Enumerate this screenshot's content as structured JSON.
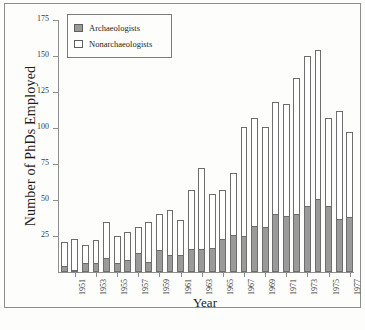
{
  "figure": {
    "y_axis_title": "Number of PhDs Employed",
    "x_axis_title": "Year"
  },
  "legend": {
    "position": "top-left",
    "entries": [
      {
        "label": "Archaeologists",
        "swatch": "filled-gray-square",
        "color": "#9a9a9a"
      },
      {
        "label": "Nonarchaeologists",
        "swatch": "open-white-square",
        "color": "#ffffff"
      }
    ]
  },
  "chart_data": {
    "type": "bar",
    "stacked": true,
    "title": "",
    "subtitle": "",
    "xlabel": "Year",
    "ylabel": "Number of PhDs Employed",
    "ylim": [
      0,
      175
    ],
    "ytick_values": [
      25,
      50,
      75,
      100,
      125,
      150,
      175
    ],
    "ytick_labels": [
      "25",
      "50",
      "75",
      "100",
      "125",
      "150",
      "175"
    ],
    "grid": false,
    "legend_position": "upper left",
    "categories": [
      "1950",
      "1951",
      "1952",
      "1953",
      "1954",
      "1955",
      "1956",
      "1957",
      "1958",
      "1959",
      "1960",
      "1961",
      "1962",
      "1963",
      "1964",
      "1965",
      "1966",
      "1967",
      "1968",
      "1969",
      "1970",
      "1971",
      "1972",
      "1973",
      "1974",
      "1975",
      "1976",
      "1977"
    ],
    "xtick_labels": [
      "",
      "1951",
      "",
      "1953",
      "",
      "1955",
      "",
      "1957",
      "",
      "1959",
      "",
      "1961",
      "",
      "1963",
      "",
      "1965",
      "",
      "1967",
      "",
      "1969",
      "",
      "1971",
      "",
      "1973",
      "",
      "1975",
      "",
      "1977"
    ],
    "series": [
      {
        "name": "Archaeologists",
        "color": "#9a9a9a",
        "values": [
          4,
          1,
          6,
          6,
          10,
          6,
          8,
          13,
          7,
          15,
          12,
          12,
          16,
          16,
          17,
          23,
          26,
          25,
          32,
          31,
          40,
          39,
          40,
          46,
          51,
          46,
          37,
          38
        ]
      },
      {
        "name": "Nonarchaeologists",
        "color": "#ffffff",
        "values": [
          17,
          22,
          13,
          16,
          25,
          19,
          20,
          18,
          28,
          25,
          31,
          24,
          41,
          56,
          37,
          34,
          43,
          76,
          75,
          70,
          78,
          78,
          95,
          104,
          103,
          61,
          75,
          59
        ]
      }
    ],
    "totals": [
      21,
      23,
      19,
      22,
      35,
      25,
      28,
      31,
      35,
      40,
      43,
      36,
      57,
      72,
      54,
      57,
      69,
      101,
      107,
      101,
      118,
      117,
      135,
      150,
      154,
      107,
      112,
      97
    ]
  }
}
